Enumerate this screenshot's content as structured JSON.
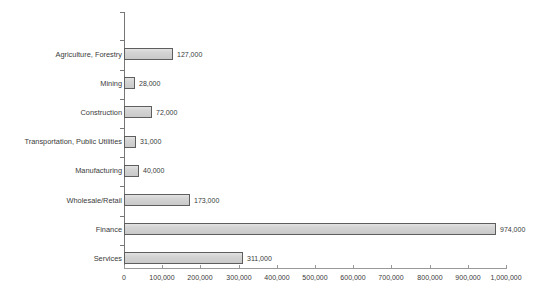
{
  "chart_data": {
    "type": "bar",
    "orientation": "horizontal",
    "title": "",
    "xlabel": "",
    "ylabel": "",
    "grid": false,
    "legend": false,
    "xlim": [
      0,
      1000000
    ],
    "xticks": [
      0,
      100000,
      200000,
      300000,
      400000,
      500000,
      600000,
      700000,
      800000,
      900000,
      1000000
    ],
    "xtick_labels": [
      "0",
      "100,000",
      "200,000",
      "300,000",
      "400,000",
      "500,000",
      "600,000",
      "700,000",
      "800,000",
      "900,000",
      "1,000,000"
    ],
    "categories": [
      "Agriculture, Forestry",
      "Mining",
      "Construction",
      "Transportation, Public Utilities",
      "Manufacturing",
      "Wholesale/Retail",
      "Finance",
      "Services"
    ],
    "values": [
      127000,
      28000,
      72000,
      31000,
      40000,
      173000,
      974000,
      311000
    ],
    "value_labels": [
      "127,000",
      "28,000",
      "72,000",
      "31,000",
      "40,000",
      "173,000",
      "974,000",
      "311,000"
    ],
    "colors": {
      "bar_fill": "#d2d2d2",
      "bar_border": "#5e5e5e",
      "axis": "#777777",
      "text": "#3a3a3a",
      "background": "#ffffff"
    }
  }
}
